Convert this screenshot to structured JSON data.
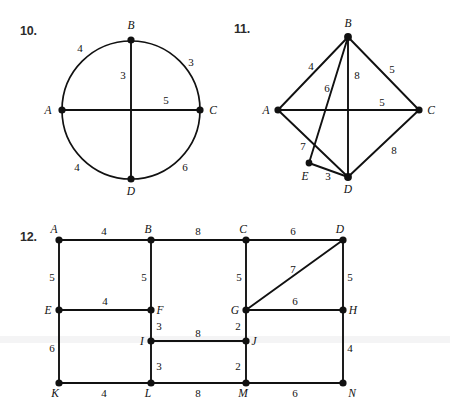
{
  "worksheet": {
    "title": "Graph theory worksheet - weighted graphs",
    "problems": [
      {
        "id": "problem-10",
        "number": "10.",
        "figure_type": "circle-with-chords",
        "vertices": [
          {
            "name": "A",
            "label": "A",
            "x": 62,
            "y": 110
          },
          {
            "name": "B",
            "label": "B",
            "x": 131,
            "y": 40
          },
          {
            "name": "C",
            "label": "C",
            "x": 200,
            "y": 110
          },
          {
            "name": "D",
            "label": "D",
            "x": 131,
            "y": 179
          }
        ],
        "center": {
          "x": 131,
          "y": 110,
          "radius": 69
        },
        "edges": [
          {
            "from": "A",
            "to": "B",
            "weight": "4",
            "kind": "arc"
          },
          {
            "from": "B",
            "to": "C",
            "weight": "3",
            "kind": "arc"
          },
          {
            "from": "C",
            "to": "D",
            "weight": "6",
            "kind": "arc"
          },
          {
            "from": "D",
            "to": "A",
            "weight": "4",
            "kind": "arc"
          },
          {
            "from": "B",
            "to": "D",
            "weight": "3",
            "kind": "chord"
          },
          {
            "from": "A",
            "to": "C",
            "weight": "5",
            "kind": "chord"
          }
        ]
      },
      {
        "id": "problem-11",
        "number": "11.",
        "figure_type": "node-link-graph",
        "vertices": [
          {
            "name": "A",
            "label": "A",
            "x": 278,
            "y": 110
          },
          {
            "name": "B",
            "label": "B",
            "x": 348,
            "y": 37
          },
          {
            "name": "C",
            "label": "C",
            "x": 419,
            "y": 110
          },
          {
            "name": "D",
            "label": "D",
            "x": 348,
            "y": 177
          },
          {
            "name": "E",
            "label": "E",
            "x": 309,
            "y": 163
          }
        ],
        "edges": [
          {
            "from": "A",
            "to": "B",
            "weight": "4"
          },
          {
            "from": "B",
            "to": "E",
            "weight": "6"
          },
          {
            "from": "B",
            "to": "D",
            "weight": "8"
          },
          {
            "from": "B",
            "to": "C",
            "weight": "5"
          },
          {
            "from": "A",
            "to": "C",
            "weight": "5"
          },
          {
            "from": "A",
            "to": "D",
            "weight": "7"
          },
          {
            "from": "E",
            "to": "D",
            "weight": "3"
          },
          {
            "from": "D",
            "to": "C",
            "weight": "8"
          }
        ]
      },
      {
        "id": "problem-12",
        "number": "12.",
        "figure_type": "grid-graph",
        "vertices": [
          {
            "name": "A",
            "label": "A",
            "x": 59,
            "y": 240
          },
          {
            "name": "B",
            "label": "B",
            "x": 151,
            "y": 240
          },
          {
            "name": "C",
            "label": "C",
            "x": 246,
            "y": 240
          },
          {
            "name": "D",
            "label": "D",
            "x": 343,
            "y": 240
          },
          {
            "name": "E",
            "label": "E",
            "x": 59,
            "y": 310
          },
          {
            "name": "F",
            "label": "F",
            "x": 151,
            "y": 310
          },
          {
            "name": "G",
            "label": "G",
            "x": 246,
            "y": 310
          },
          {
            "name": "H",
            "label": "H",
            "x": 343,
            "y": 310
          },
          {
            "name": "I",
            "label": "I",
            "x": 151,
            "y": 341
          },
          {
            "name": "J",
            "label": "J",
            "x": 246,
            "y": 341
          },
          {
            "name": "K",
            "label": "K",
            "x": 59,
            "y": 383
          },
          {
            "name": "L",
            "label": "L",
            "x": 151,
            "y": 383
          },
          {
            "name": "M",
            "label": "M",
            "x": 246,
            "y": 383
          },
          {
            "name": "N",
            "label": "N",
            "x": 343,
            "y": 383
          }
        ],
        "edges": [
          {
            "from": "A",
            "to": "B",
            "weight": "4"
          },
          {
            "from": "B",
            "to": "C",
            "weight": "8"
          },
          {
            "from": "C",
            "to": "D",
            "weight": "6"
          },
          {
            "from": "A",
            "to": "E",
            "weight": "5"
          },
          {
            "from": "B",
            "to": "F",
            "weight": "5"
          },
          {
            "from": "C",
            "to": "G",
            "weight": "5"
          },
          {
            "from": "D",
            "to": "H",
            "weight": "5"
          },
          {
            "from": "D",
            "to": "G",
            "weight": "7"
          },
          {
            "from": "E",
            "to": "F",
            "weight": "4"
          },
          {
            "from": "G",
            "to": "H",
            "weight": "6"
          },
          {
            "from": "F",
            "to": "I",
            "weight": "3"
          },
          {
            "from": "G",
            "to": "J",
            "weight": "2"
          },
          {
            "from": "I",
            "to": "J",
            "weight": "8"
          },
          {
            "from": "I",
            "to": "L",
            "weight": "3"
          },
          {
            "from": "J",
            "to": "M",
            "weight": "2"
          },
          {
            "from": "E",
            "to": "K",
            "weight": "6"
          },
          {
            "from": "H",
            "to": "N",
            "weight": "4"
          },
          {
            "from": "K",
            "to": "L",
            "weight": "4"
          },
          {
            "from": "L",
            "to": "M",
            "weight": "8"
          },
          {
            "from": "M",
            "to": "N",
            "weight": "6"
          }
        ]
      }
    ],
    "vertex_labels": {
      "p10": {
        "A": "A",
        "B": "B",
        "C": "C",
        "D": "D"
      },
      "p11": {
        "A": "A",
        "B": "B",
        "C": "C",
        "D": "D",
        "E": "E"
      },
      "p12": {
        "A": "A",
        "B": "B",
        "C": "C",
        "D": "D",
        "E": "E",
        "F": "F",
        "G": "G",
        "H": "H",
        "I": "I",
        "J": "J",
        "K": "K",
        "L": "L",
        "M": "M",
        "N": "N"
      }
    },
    "weight_labels": {
      "p10": {
        "ab": "4",
        "bc": "3",
        "bo": "3",
        "ac": "5",
        "da": "4",
        "cd": "6"
      },
      "p11": {
        "ab": "4",
        "be": "6",
        "bd": "8",
        "bc": "5",
        "ac": "5",
        "ad": "7",
        "ed": "3",
        "dc": "8"
      },
      "p12": {
        "ab": "4",
        "bc": "8",
        "cd": "6",
        "ae": "5",
        "bf": "5",
        "cg": "5",
        "dh": "5",
        "dg": "7",
        "ef": "4",
        "gh": "6",
        "fi": "3",
        "gj": "2",
        "ij": "8",
        "il": "3",
        "jm": "2",
        "ek": "6",
        "hn": "4",
        "kl": "4",
        "lm": "8",
        "mn": "6"
      }
    },
    "colors": {
      "ink": "#111111",
      "paper": "#ffffff",
      "number_ink": "#2b2b2b"
    }
  }
}
